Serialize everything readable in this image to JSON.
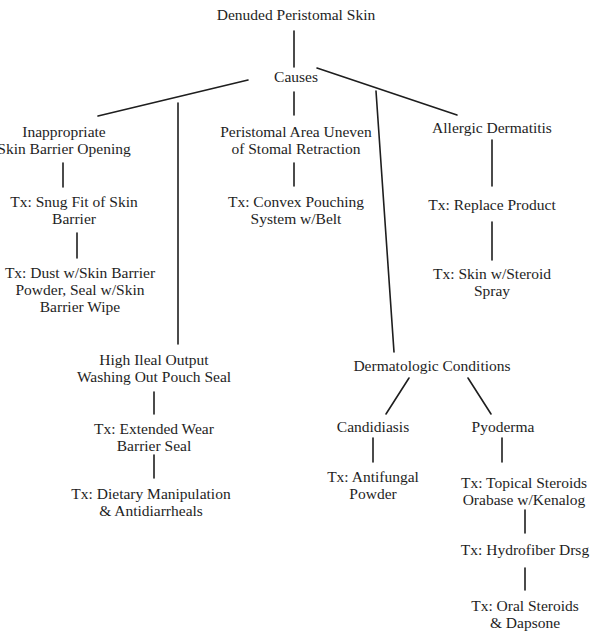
{
  "diagram": {
    "type": "tree",
    "root": {
      "label": "Denuded Peristomal Skin"
    },
    "causes_hub": {
      "label": "Causes"
    },
    "branches": {
      "inappropriate_opening": {
        "cause": [
          "Inappropriate",
          "Skin Barrier Opening"
        ],
        "treatments": [
          [
            "Tx: Snug Fit of Skin",
            "Barrier"
          ],
          [
            "Tx: Dust w/Skin Barrier",
            "Powder, Seal w/Skin",
            "Barrier Wipe"
          ]
        ]
      },
      "high_ileal_output": {
        "cause": [
          "High Ileal Output",
          "Washing Out Pouch Seal"
        ],
        "treatments": [
          [
            "Tx: Extended Wear",
            "Barrier Seal"
          ],
          [
            "Tx: Dietary Manipulation",
            "& Antidiarrheals"
          ]
        ]
      },
      "uneven_area": {
        "cause": [
          "Peristomal Area Uneven",
          "of Stomal Retraction"
        ],
        "treatments": [
          [
            "Tx: Convex Pouching",
            "System w/Belt"
          ]
        ]
      },
      "allergic_dermatitis": {
        "cause": [
          "Allergic Dermatitis"
        ],
        "treatments": [
          [
            "Tx: Replace Product"
          ],
          [
            "Tx: Skin w/Steroid",
            "Spray"
          ]
        ]
      },
      "dermatologic_conditions": {
        "cause": [
          "Dermatologic Conditions"
        ],
        "sub": {
          "candidiasis": {
            "label": [
              "Candidiasis"
            ],
            "treatments": [
              [
                "Tx: Antifungal",
                "Powder"
              ]
            ]
          },
          "pyoderma": {
            "label": [
              "Pyoderma"
            ],
            "treatments": [
              [
                "Tx: Topical Steroids",
                "Orabase w/Kenalog"
              ],
              [
                "Tx: Hydrofiber Drsg"
              ],
              [
                "Tx: Oral Steroids",
                "& Dapsone"
              ]
            ]
          }
        }
      }
    }
  }
}
